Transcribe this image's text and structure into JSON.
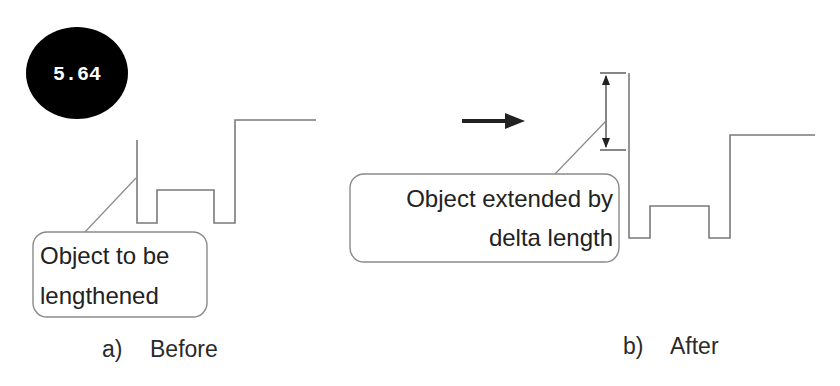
{
  "badge": {
    "label": "5.64",
    "color": "#000000",
    "text_color": "#ffffff"
  },
  "before": {
    "caption_letter": "a)",
    "caption_text": "Before",
    "callout": {
      "lines": [
        "Object to be",
        "lengthened"
      ]
    }
  },
  "after": {
    "caption_letter": "b)",
    "caption_text": "After",
    "callout": {
      "lines": [
        "Object extended by",
        "delta length"
      ]
    }
  },
  "transition": {
    "icon": "right-arrow-icon"
  },
  "dimension": {
    "icon": "double-headed-dimension-arrow-icon",
    "meaning": "delta length"
  },
  "colors": {
    "line": "#7a7a7a",
    "text": "#222222",
    "arrow": "#222222"
  }
}
